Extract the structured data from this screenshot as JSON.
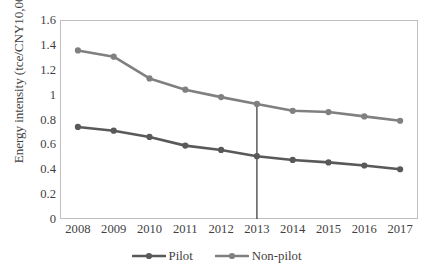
{
  "chart_data": {
    "type": "line",
    "title": "",
    "xlabel": "",
    "ylabel": "Energy intensity (tce/CNY10,000)",
    "categories": [
      "2008",
      "2009",
      "2010",
      "2011",
      "2012",
      "2013",
      "2014",
      "2015",
      "2016",
      "2017"
    ],
    "x": [
      2008,
      2009,
      2010,
      2011,
      2012,
      2013,
      2014,
      2015,
      2016,
      2017
    ],
    "ylim": [
      0,
      1.6
    ],
    "yticks": [
      "0",
      "0.2",
      "0.4",
      "0.6",
      "0.8",
      "1",
      "1.2",
      "1.4",
      "1.6"
    ],
    "ytick_values": [
      0,
      0.2,
      0.4,
      0.6,
      0.8,
      1.0,
      1.2,
      1.4,
      1.6
    ],
    "grid": false,
    "legend_position": "bottom",
    "series": [
      {
        "name": "Pilot",
        "color": "#595959",
        "values": [
          0.74,
          0.71,
          0.66,
          0.59,
          0.555,
          0.505,
          0.475,
          0.455,
          0.43,
          0.4
        ]
      },
      {
        "name": "Non-pilot",
        "color": "#808080",
        "values": [
          1.355,
          1.305,
          1.13,
          1.04,
          0.98,
          0.925,
          0.87,
          0.86,
          0.825,
          0.79
        ]
      }
    ],
    "annotations": [
      {
        "type": "vertical-line",
        "x": 2013,
        "label": "",
        "color": "#404040",
        "y_from": 0,
        "y_to": 0.925
      }
    ]
  },
  "legend": {
    "entries": [
      {
        "label": "Pilot",
        "color": "#595959"
      },
      {
        "label": "Non-pilot",
        "color": "#808080"
      }
    ]
  },
  "colors": {
    "pilot": "#595959",
    "non_pilot": "#808080",
    "axis": "#bfbfbf",
    "text": "#3f3f3f",
    "background": "#ffffff"
  }
}
